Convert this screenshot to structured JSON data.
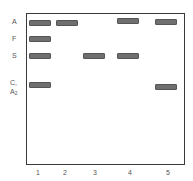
{
  "figure": {
    "type": "hemoglobin electrophoresis gel",
    "row_labels": [
      {
        "id": "A",
        "text": "A",
        "y": 19
      },
      {
        "id": "F",
        "text": "F",
        "y": 35
      },
      {
        "id": "S",
        "text": "S",
        "y": 52
      },
      {
        "id": "C",
        "text": "C,",
        "y": 80
      },
      {
        "id": "A2",
        "text": "A",
        "sub": "2",
        "y": 89
      }
    ],
    "lanes": [
      {
        "label": "1",
        "x": 29,
        "bands": [
          "A",
          "F",
          "S",
          "C/A2"
        ]
      },
      {
        "label": "2",
        "x": 56,
        "bands": [
          "A"
        ]
      },
      {
        "label": "3",
        "x": 83,
        "bands": [
          "S"
        ]
      },
      {
        "label": "4",
        "x": 117,
        "bands": [
          "A",
          "S"
        ]
      },
      {
        "label": "5",
        "x": 155,
        "bands": [
          "A",
          "C/A2"
        ]
      }
    ],
    "colors": {
      "band": "#6f6f6f",
      "frame": "#3a3a3a",
      "text": "#555555"
    }
  }
}
